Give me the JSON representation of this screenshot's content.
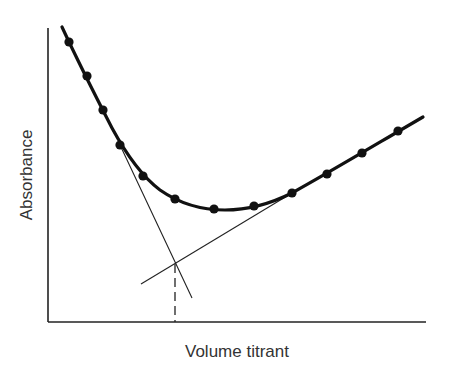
{
  "chart_data": {
    "type": "scatter",
    "title": "",
    "xlabel": "Volume titrant",
    "ylabel": "Absorbance",
    "grid": false,
    "legend": null,
    "x_ticks": [],
    "y_ticks": [],
    "series": [
      {
        "name": "measured points",
        "style": "filled-circles-with-smooth-curve",
        "x_rel": [
          0.06,
          0.1,
          0.145,
          0.19,
          0.25,
          0.335,
          0.44,
          0.545,
          0.645,
          0.74,
          0.83,
          0.925
        ],
        "y_rel": [
          0.95,
          0.84,
          0.72,
          0.6,
          0.5,
          0.42,
          0.385,
          0.395,
          0.44,
          0.5,
          0.575,
          0.65
        ]
      }
    ],
    "annotations": [
      {
        "type": "line",
        "name": "descending-extrapolation",
        "description": "tangent extending the falling branch"
      },
      {
        "type": "line",
        "name": "ascending-extrapolation",
        "description": "tangent extending the rising branch"
      },
      {
        "type": "dashed-vline",
        "name": "end-point",
        "x_rel": 0.335,
        "description": "drop from intersection to x-axis"
      }
    ]
  },
  "geometry": {
    "axes": {
      "x0": 48,
      "y0": 322,
      "x1": 426,
      "ytop": 28
    },
    "curve_path": "M62,27 C75,55 95,95 112,128 C125,152 140,175 160,190 C180,204 200,210 225,210 C250,210 270,204 292,193 C330,172 380,142 423,117",
    "points": [
      [
        69,
        42
      ],
      [
        87,
        76
      ],
      [
        103,
        110
      ],
      [
        120,
        145
      ],
      [
        143,
        176
      ],
      [
        175,
        199
      ],
      [
        214,
        209
      ],
      [
        254,
        206
      ],
      [
        292,
        193
      ],
      [
        327,
        174
      ],
      [
        362,
        153
      ],
      [
        398,
        131
      ]
    ],
    "tangent_left": [
      120,
      145,
      192,
      298
    ],
    "tangent_right": [
      141,
      284,
      292,
      193
    ],
    "dash_line": [
      175,
      264,
      175,
      322
    ]
  },
  "labels": {
    "x_axis": "Volume titrant",
    "y_axis": "Absorbance"
  }
}
